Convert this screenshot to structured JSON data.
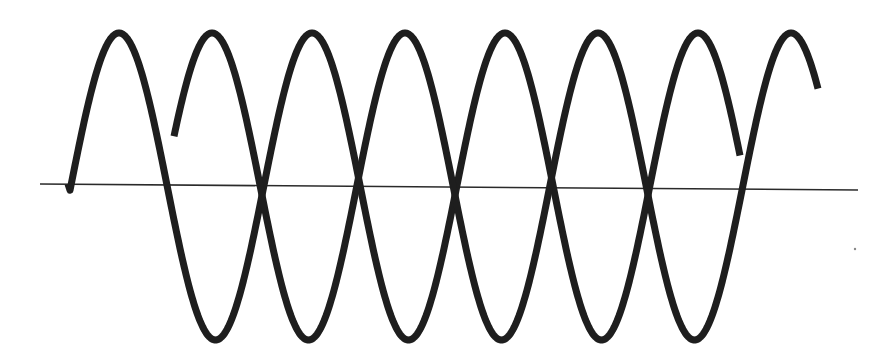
{
  "diagram": {
    "title": "",
    "colors": {
      "background": "#ffffff",
      "wave": "#1e1e1e",
      "baseline": "#2a2a2a"
    },
    "baseline": {
      "x1": 40,
      "y1": 184,
      "x2": 858,
      "y2": 190
    },
    "amplitude_top_y": 33,
    "amplitude_bottom_y": 340,
    "waves": [
      {
        "name": "wave-a",
        "start": {
          "x": 68,
          "y": 184
        },
        "peaks_x": [
          119,
          312,
          505,
          697
        ],
        "troughs_x": [
          212,
          405,
          597
        ],
        "end": {
          "x": 740,
          "y": 138
        }
      },
      {
        "name": "wave-b",
        "start": {
          "x": 174,
          "y": 140
        },
        "peaks_x": [
          212,
          405,
          597,
          795
        ],
        "troughs_x": [
          307,
          499,
          693
        ],
        "end": {
          "x": 818,
          "y": 74
        }
      }
    ],
    "crossings_x": [
      163,
      260,
      357,
      455,
      552,
      648,
      742
    ]
  }
}
